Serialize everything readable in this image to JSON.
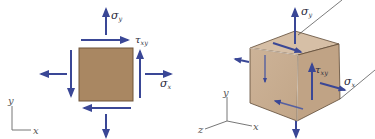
{
  "figure": {
    "plane_stress_element": {
      "labels": {
        "sigma_y": "σ",
        "sigma_y_sub": "y",
        "tau_xy": "τ",
        "tau_xy_sub": "xy",
        "sigma_x": "σ",
        "sigma_x_sub": "x"
      },
      "axes": {
        "y": "y",
        "x": "x"
      }
    },
    "cube_element": {
      "labels": {
        "sigma_y": "σ",
        "sigma_y_sub": "y",
        "tau_xy": "τ",
        "tau_xy_sub": "xy",
        "sigma_x": "σ",
        "sigma_x_sub": "x"
      },
      "axes": {
        "y": "y",
        "x": "x",
        "z": "z"
      }
    }
  },
  "colors": {
    "arrow": "#3a4796",
    "square_fill": "#a98762",
    "square_border": "#6f5538",
    "cube_front": "#c9ae92",
    "cube_top": "#d8c2aa",
    "cube_side": "#bb9e80",
    "axis": "#777777"
  }
}
